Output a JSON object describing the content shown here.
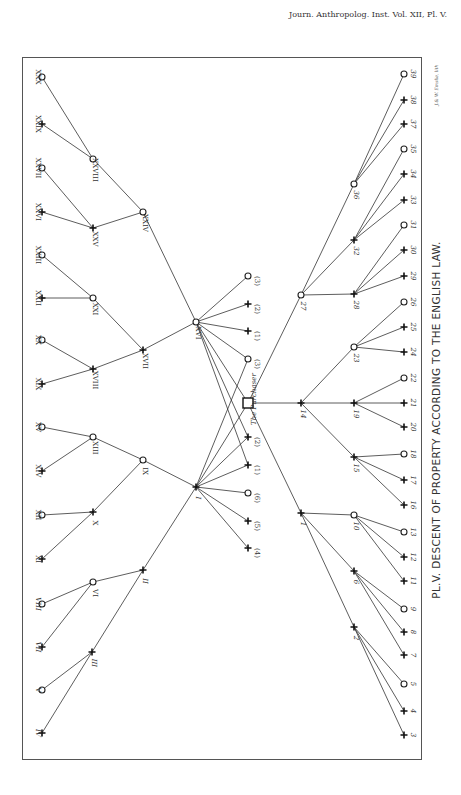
{
  "journal_ref": "Journ. Anthropolog. Inst. Vol. XII, Pl. V.",
  "caption": "PL.V. DESCENT OF PROPERTY ACCORDING TO THE ENGLISH LAW.",
  "engraver": "J.& W. Emslie, lith",
  "purchaser_label": "The Purchaser",
  "legend": {
    "plus": "male",
    "circle": "female",
    "square": "purchaser"
  },
  "nodes": {
    "P": {
      "label": "",
      "mark": "square"
    },
    "I_left": {
      "label": "I",
      "mark": "plus"
    },
    "XVI": {
      "label": "XVI",
      "mark": "circle"
    },
    "II": {
      "label": "II",
      "mark": "plus"
    },
    "III": {
      "label": "III",
      "mark": "plus"
    },
    "IV": {
      "label": "IV",
      "mark": "plus"
    },
    "V": {
      "label": "V",
      "mark": "circle"
    },
    "VI": {
      "label": "VI",
      "mark": "circle"
    },
    "VII": {
      "label": "VII",
      "mark": "plus"
    },
    "VIII": {
      "label": "VIII",
      "mark": "circle"
    },
    "IX": {
      "label": "IX",
      "mark": "circle"
    },
    "X": {
      "label": "X",
      "mark": "plus"
    },
    "XI": {
      "label": "XI",
      "mark": "plus"
    },
    "XII": {
      "label": "XII",
      "mark": "circle"
    },
    "XIII": {
      "label": "XIII",
      "mark": "circle"
    },
    "XIV": {
      "label": "XIV",
      "mark": "plus"
    },
    "XV": {
      "label": "XV",
      "mark": "circle"
    },
    "XVII": {
      "label": "XVII",
      "mark": "plus"
    },
    "XVIII": {
      "label": "XVIII",
      "mark": "plus"
    },
    "XIX": {
      "label": "XIX",
      "mark": "plus"
    },
    "XX": {
      "label": "XX",
      "mark": "circle"
    },
    "XXI": {
      "label": "XXI",
      "mark": "circle"
    },
    "XXII": {
      "label": "XXII",
      "mark": "plus"
    },
    "XXIII": {
      "label": "XXIII",
      "mark": "circle"
    },
    "XXIV": {
      "label": "XXIV",
      "mark": "circle"
    },
    "XXV": {
      "label": "XXV",
      "mark": "plus"
    },
    "XXVI": {
      "label": "XXVI",
      "mark": "plus"
    },
    "XXVII": {
      "label": "XXVII",
      "mark": "circle"
    },
    "XXVIII": {
      "label": "XXVIII",
      "mark": "circle"
    },
    "XXIX": {
      "label": "XXIX",
      "mark": "plus"
    },
    "XXX": {
      "label": "XXX",
      "mark": "circle"
    },
    "c1": {
      "label": "(1)",
      "mark": "plus"
    },
    "c2": {
      "label": "(2)",
      "mark": "plus"
    },
    "c3": {
      "label": "(3)",
      "mark": "circle"
    },
    "c4": {
      "label": "(4)",
      "mark": "plus"
    },
    "c5": {
      "label": "(5)",
      "mark": "plus"
    },
    "c6": {
      "label": "(6)",
      "mark": "circle"
    },
    "d1": {
      "label": "(1)",
      "mark": "plus"
    },
    "d2": {
      "label": "(2)",
      "mark": "plus"
    },
    "d3": {
      "label": "(3)",
      "mark": "circle"
    },
    "n1": {
      "label": "1",
      "mark": "plus"
    },
    "n2": {
      "label": "2",
      "mark": "plus"
    },
    "n3": {
      "label": "3",
      "mark": "plus"
    },
    "n4": {
      "label": "4",
      "mark": "plus"
    },
    "n5": {
      "label": "5",
      "mark": "circle"
    },
    "n6": {
      "label": "6",
      "mark": "plus"
    },
    "n7": {
      "label": "7",
      "mark": "plus"
    },
    "n8": {
      "label": "8",
      "mark": "plus"
    },
    "n9": {
      "label": "9",
      "mark": "circle"
    },
    "n10": {
      "label": "10",
      "mark": "circle"
    },
    "n11": {
      "label": "11",
      "mark": "plus"
    },
    "n12": {
      "label": "12",
      "mark": "plus"
    },
    "n13": {
      "label": "13",
      "mark": "circle"
    },
    "n14": {
      "label": "14",
      "mark": "plus"
    },
    "n15": {
      "label": "15",
      "mark": "plus"
    },
    "n16": {
      "label": "16",
      "mark": "plus"
    },
    "n17": {
      "label": "17",
      "mark": "plus"
    },
    "n18": {
      "label": "18",
      "mark": "circle"
    },
    "n19": {
      "label": "19",
      "mark": "plus"
    },
    "n20": {
      "label": "20",
      "mark": "plus"
    },
    "n21": {
      "label": "21",
      "mark": "plus"
    },
    "n22": {
      "label": "22",
      "mark": "circle"
    },
    "n23": {
      "label": "23",
      "mark": "circle"
    },
    "n24": {
      "label": "24",
      "mark": "plus"
    },
    "n25": {
      "label": "25",
      "mark": "plus"
    },
    "n26": {
      "label": "26",
      "mark": "circle"
    },
    "n27": {
      "label": "27",
      "mark": "circle"
    },
    "n28": {
      "label": "28",
      "mark": "plus"
    },
    "n29": {
      "label": "29",
      "mark": "plus"
    },
    "n30": {
      "label": "30",
      "mark": "plus"
    },
    "n31": {
      "label": "31",
      "mark": "circle"
    },
    "n32": {
      "label": "32",
      "mark": "plus"
    },
    "n33": {
      "label": "33",
      "mark": "plus"
    },
    "n34": {
      "label": "34",
      "mark": "plus"
    },
    "n35": {
      "label": "35",
      "mark": "circle"
    },
    "n36": {
      "label": "36",
      "mark": "circle"
    },
    "n37": {
      "label": "37",
      "mark": "plus"
    },
    "n38": {
      "label": "38",
      "mark": "plus"
    },
    "n39": {
      "label": "39",
      "mark": "circle"
    }
  },
  "edges": [
    [
      "P",
      "I_left"
    ],
    [
      "P",
      "XVI"
    ],
    [
      "P",
      "n1"
    ],
    [
      "P",
      "n14"
    ],
    [
      "P",
      "n27"
    ],
    [
      "I_left",
      "II"
    ],
    [
      "II",
      "III"
    ],
    [
      "III",
      "IV"
    ],
    [
      "III",
      "V"
    ],
    [
      "II",
      "VI"
    ],
    [
      "VI",
      "VII"
    ],
    [
      "VI",
      "VIII"
    ],
    [
      "I_left",
      "IX"
    ],
    [
      "IX",
      "X"
    ],
    [
      "X",
      "XI"
    ],
    [
      "X",
      "XII"
    ],
    [
      "IX",
      "XIII"
    ],
    [
      "XIII",
      "XIV"
    ],
    [
      "XIII",
      "XV"
    ],
    [
      "I_left",
      "c1"
    ],
    [
      "I_left",
      "c2"
    ],
    [
      "I_left",
      "c3"
    ],
    [
      "I_left",
      "c4"
    ],
    [
      "I_left",
      "c5"
    ],
    [
      "I_left",
      "c6"
    ],
    [
      "XVI",
      "XVII"
    ],
    [
      "XVII",
      "XVIII"
    ],
    [
      "XVIII",
      "XIX"
    ],
    [
      "XVIII",
      "XX"
    ],
    [
      "XVII",
      "XXI"
    ],
    [
      "XXI",
      "XXII"
    ],
    [
      "XXI",
      "XXIII"
    ],
    [
      "XVI",
      "XXIV"
    ],
    [
      "XXIV",
      "XXV"
    ],
    [
      "XXV",
      "XXVI"
    ],
    [
      "XXV",
      "XXVII"
    ],
    [
      "XXIV",
      "XXVIII"
    ],
    [
      "XXVIII",
      "XXIX"
    ],
    [
      "XXVIII",
      "XXX"
    ],
    [
      "XVI",
      "d1"
    ],
    [
      "XVI",
      "d2"
    ],
    [
      "XVI",
      "d3"
    ],
    [
      "XVI",
      "c1"
    ],
    [
      "XVI",
      "c2"
    ],
    [
      "XVI",
      "c3"
    ],
    [
      "n1",
      "n2"
    ],
    [
      "n2",
      "n3"
    ],
    [
      "n2",
      "n4"
    ],
    [
      "n2",
      "n5"
    ],
    [
      "n1",
      "n6"
    ],
    [
      "n6",
      "n7"
    ],
    [
      "n6",
      "n8"
    ],
    [
      "n6",
      "n9"
    ],
    [
      "n1",
      "n10"
    ],
    [
      "n10",
      "n11"
    ],
    [
      "n10",
      "n12"
    ],
    [
      "n10",
      "n13"
    ],
    [
      "n14",
      "n15"
    ],
    [
      "n15",
      "n16"
    ],
    [
      "n15",
      "n17"
    ],
    [
      "n15",
      "n18"
    ],
    [
      "n14",
      "n19"
    ],
    [
      "n19",
      "n20"
    ],
    [
      "n19",
      "n21"
    ],
    [
      "n19",
      "n22"
    ],
    [
      "n14",
      "n23"
    ],
    [
      "n23",
      "n24"
    ],
    [
      "n23",
      "n25"
    ],
    [
      "n23",
      "n26"
    ],
    [
      "n27",
      "n28"
    ],
    [
      "n28",
      "n29"
    ],
    [
      "n28",
      "n30"
    ],
    [
      "n28",
      "n31"
    ],
    [
      "n27",
      "n32"
    ],
    [
      "n32",
      "n33"
    ],
    [
      "n32",
      "n34"
    ],
    [
      "n32",
      "n35"
    ],
    [
      "n27",
      "n36"
    ],
    [
      "n36",
      "n37"
    ],
    [
      "n36",
      "n38"
    ],
    [
      "n36",
      "n39"
    ]
  ]
}
